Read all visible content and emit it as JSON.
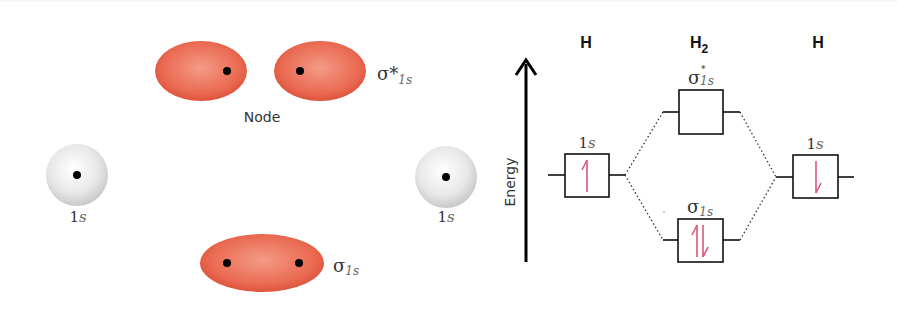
{
  "colors": {
    "lobe": "#e8604a",
    "lobe_light": "#f3907c",
    "sphere": "#e6e6e6",
    "electron_arrow": "#d9577a",
    "line": "#111111"
  },
  "orbital_pictures": {
    "antibonding": {
      "symbol": "σ*",
      "subscript": "1s",
      "node_label": "Node"
    },
    "left_atom": {
      "label_main": "1",
      "label_sub": "s"
    },
    "right_atom": {
      "label_main": "1",
      "label_sub": "s"
    },
    "bonding": {
      "symbol": "σ",
      "subscript": "1s"
    }
  },
  "energy_diagram": {
    "axis_label": "Energy",
    "columns": [
      {
        "header": "H",
        "sub": ""
      },
      {
        "header": "H",
        "sub": "2"
      },
      {
        "header": "H",
        "sub": ""
      }
    ],
    "levels": {
      "left_ao": {
        "label_main": "1",
        "label_sub": "s",
        "electrons": "↑"
      },
      "sigma_star": {
        "symbol": "σ",
        "star": "*",
        "subscript": "1s",
        "electrons": ""
      },
      "sigma": {
        "symbol": "σ",
        "subscript": "1s",
        "electrons": "↑↓"
      },
      "right_ao": {
        "label_main": "1",
        "label_sub": "s",
        "electrons": "↓"
      }
    }
  }
}
